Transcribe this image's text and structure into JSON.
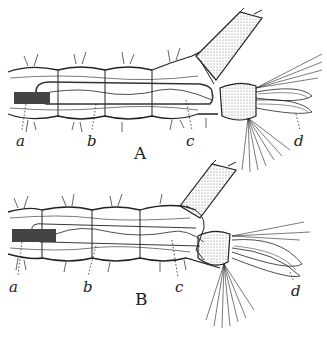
{
  "figures": [
    {
      "id": "A",
      "label": "A",
      "callouts": [
        {
          "letter": "a"
        },
        {
          "letter": "b"
        },
        {
          "letter": "c"
        },
        {
          "letter": "d"
        }
      ]
    },
    {
      "id": "B",
      "label": "B",
      "callouts": [
        {
          "letter": "a"
        },
        {
          "letter": "b"
        },
        {
          "letter": "c"
        },
        {
          "letter": "d"
        }
      ]
    }
  ],
  "colors": {
    "ink": "#222222",
    "background": "#ffffff",
    "stipple": "#9a9a9a"
  }
}
